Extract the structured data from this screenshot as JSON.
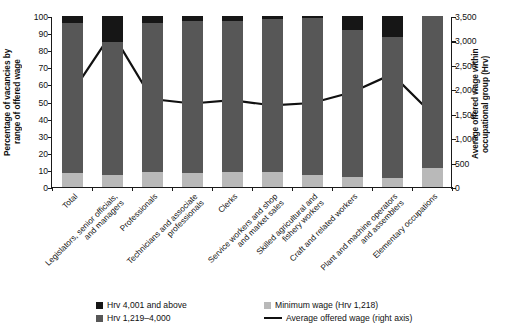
{
  "chart_data": {
    "type": "bar",
    "title": "",
    "subtitle": "",
    "stacked": true,
    "xlabel": "",
    "ylabel": "Percentage of vacancies by\nrange of offered wage",
    "y2label": "Average offered wage within\noccupational group (Hrv)",
    "ylim": [
      0,
      100
    ],
    "y2lim": [
      0,
      3500
    ],
    "yticks": [
      "100",
      "90",
      "80",
      "70",
      "60",
      "50",
      "40",
      "30",
      "20",
      "10",
      "0"
    ],
    "ytick_values": [
      100,
      90,
      80,
      70,
      60,
      50,
      40,
      30,
      20,
      10,
      0
    ],
    "y2ticks": [
      "3,500",
      "3,000",
      "2,500",
      "2,000",
      "1,500",
      "1,000",
      "500",
      "0"
    ],
    "y2tick_values": [
      3500,
      3000,
      2500,
      2000,
      1500,
      1000,
      500,
      0
    ],
    "grid": false,
    "legend_position": "bottom",
    "categories": [
      "Total",
      "Legislators, senior officials,\nand managers",
      "Professionals",
      "Technicians and associate\nprofessionals",
      "Clerks",
      "Service workers and shop\nand market sales",
      "Skilled agricultural and\nfishery workers",
      "Craft and related workers",
      "Plant and machine operators\nand assemblers",
      "Elementary occupations"
    ],
    "series": [
      {
        "name": "Minimum wage (Hrv 1,218)",
        "color": "#b9b9b9",
        "axis": "left",
        "values": [
          8.0,
          6.8,
          8.5,
          8.0,
          9.0,
          8.5,
          7.0,
          6.0,
          5.5,
          11.0
        ]
      },
      {
        "name": "Hrv 1,219–4,000",
        "color": "#575757",
        "axis": "left",
        "values": [
          88.0,
          78.2,
          87.5,
          89.0,
          88.0,
          89.5,
          92.0,
          86.0,
          82.5,
          89.0
        ]
      },
      {
        "name": "Hrv 4,001 and above",
        "color": "#161616",
        "axis": "left",
        "values": [
          4.0,
          15.0,
          4.0,
          3.0,
          3.0,
          2.0,
          1.0,
          8.0,
          12.0,
          0.0
        ]
      }
    ],
    "line_series": {
      "name": "Average offered wage (right axis)",
      "color": "#111111",
      "axis": "right",
      "unit": "Hrv",
      "values": [
        1950,
        3180,
        1820,
        1730,
        1800,
        1690,
        1740,
        1960,
        2330,
        1520
      ]
    }
  },
  "legend": {
    "items": [
      {
        "label": "Hrv 4,001 and above",
        "marker": "square",
        "color": "#161616"
      },
      {
        "label": "Minimum wage (Hrv 1,218)",
        "marker": "square",
        "color": "#b9b9b9"
      },
      {
        "label": "Hrv 1,219–4,000",
        "marker": "square",
        "color": "#575757"
      },
      {
        "label": "Average offered wage (right axis)",
        "marker": "line",
        "color": "#111111"
      }
    ]
  }
}
